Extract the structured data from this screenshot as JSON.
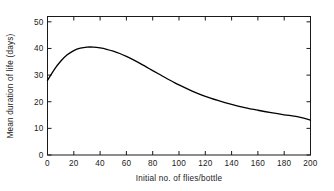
{
  "chart_data": {
    "type": "line",
    "title": "",
    "xlabel": "Initial no. of flies/bottle",
    "ylabel": "Mean duration of life (days)",
    "xlim": [
      0,
      200
    ],
    "ylim": [
      0,
      52
    ],
    "xticks": [
      0,
      20,
      40,
      60,
      80,
      100,
      120,
      140,
      160,
      180,
      200
    ],
    "yticks": [
      0,
      10,
      20,
      30,
      40,
      50
    ],
    "xtick_labels": [
      "0",
      "20",
      "40",
      "60",
      "80",
      "100",
      "120",
      "140",
      "160",
      "180",
      "200"
    ],
    "ytick_labels": [
      "0",
      "10",
      "20",
      "30",
      "40",
      "50"
    ],
    "grid": false,
    "legend": null,
    "frame": "box",
    "tick_direction": "in",
    "series": [
      {
        "name": "Mean duration of life",
        "color": "#000000",
        "x": [
          0,
          5,
          10,
          15,
          20,
          25,
          30,
          35,
          40,
          45,
          50,
          55,
          60,
          65,
          70,
          75,
          80,
          85,
          90,
          95,
          100,
          110,
          120,
          130,
          140,
          150,
          160,
          170,
          180,
          190,
          200
        ],
        "y": [
          28.0,
          32.0,
          35.2,
          37.6,
          39.2,
          40.1,
          40.5,
          40.5,
          40.2,
          39.7,
          39.0,
          38.1,
          37.0,
          35.8,
          34.5,
          33.1,
          31.7,
          30.3,
          28.9,
          27.6,
          26.3,
          24.0,
          22.0,
          20.4,
          19.0,
          17.8,
          16.8,
          15.9,
          15.1,
          14.4,
          13.1
        ]
      }
    ]
  },
  "axes": {
    "x_title": "Initial no. of flies/bottle",
    "y_title": "Mean duration of life (days)"
  }
}
